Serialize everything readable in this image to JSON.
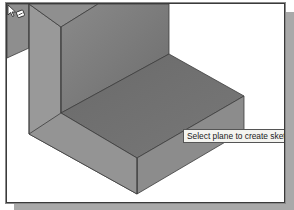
{
  "viewport": {
    "background": "#ffffff",
    "model": {
      "name": "L-shaped block",
      "face_colors": {
        "left_partial": "#8e8e8e",
        "wall_front": "#999999",
        "wall_top": "#8f8f8f",
        "wall_inner": "#7f7f7f",
        "step_top": "#6e6e6e",
        "step_front": "#8a8a8a",
        "step_right": "#7a7a7a",
        "edge": "#3c3c3c"
      }
    },
    "cursor": {
      "icon": "select-pointer-with-sketch-icon"
    },
    "tooltip": {
      "text": "Select plane to create sketch or"
    }
  }
}
